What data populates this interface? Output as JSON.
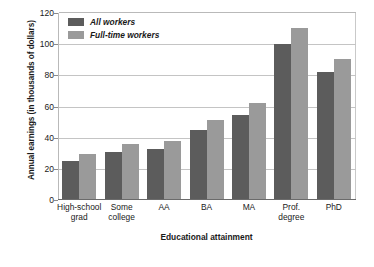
{
  "chart_data": {
    "type": "bar",
    "title": "",
    "xlabel": "Educational attainment",
    "ylabel": "Annual earnings (in thousands of dollars)",
    "ylim": [
      0,
      120
    ],
    "yticks": [
      0,
      20,
      40,
      60,
      80,
      100,
      120
    ],
    "grid": true,
    "legend_position": "top-left",
    "categories": [
      "High-school grad",
      "Some college",
      "AA",
      "BA",
      "MA",
      "Prof. degree",
      "PhD"
    ],
    "category_lines": [
      [
        "High-school",
        "grad"
      ],
      [
        "Some",
        "college"
      ],
      [
        "AA"
      ],
      [
        "BA"
      ],
      [
        "MA"
      ],
      [
        "Prof.",
        "degree"
      ],
      [
        "PhD"
      ]
    ],
    "series": [
      {
        "name": "All workers",
        "color": "#5c5c5c",
        "values": [
          25,
          30.5,
          32.5,
          45,
          54.5,
          100,
          82
        ]
      },
      {
        "name": "Full-time workers",
        "color": "#9a9a9a",
        "values": [
          29.5,
          36,
          38,
          51.5,
          62.5,
          110.5,
          90.5
        ]
      }
    ]
  },
  "axis": {
    "y_tick_labels": [
      "0",
      "20",
      "40",
      "60",
      "80",
      "100",
      "120"
    ]
  }
}
